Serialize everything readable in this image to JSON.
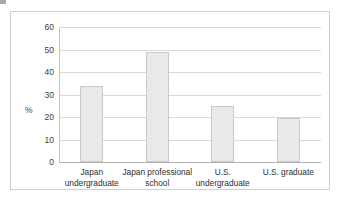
{
  "figure": {
    "name": "bar-chart-figure",
    "background": "#ffffff",
    "frame_color": "#cfcfcf",
    "artifact": "scan-speck"
  },
  "chart_data": {
    "type": "bar",
    "title": "",
    "subtitle": "",
    "xlabel": "",
    "ylabel": "%",
    "categories": [
      "Japan\nundergraduate",
      "Japan professional\nschool",
      "U.S.\nundergraduate",
      "U.S. graduate"
    ],
    "values": [
      34,
      49,
      25,
      19.5
    ],
    "ylim": [
      0,
      60
    ],
    "yticks": [
      0,
      10,
      20,
      30,
      40,
      50,
      60
    ],
    "ytick_labels": [
      "0",
      "10",
      "20",
      "30",
      "40",
      "50",
      "60"
    ],
    "grid": true,
    "grid_axis": "y",
    "legend": "none",
    "bar_fill": "#e9e9e9",
    "bar_border": "#c9c9c9",
    "gridline_color": "#d9d9d9",
    "axis_color": "#b3b3b3"
  }
}
